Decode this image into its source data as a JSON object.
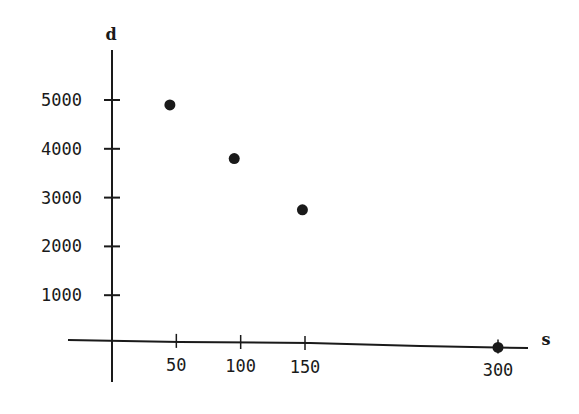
{
  "chart_data": {
    "type": "scatter",
    "title": "",
    "xlabel": "s",
    "ylabel": "d",
    "x_ticks": [
      50,
      100,
      150,
      300
    ],
    "y_ticks": [
      1000,
      2000,
      3000,
      4000,
      5000
    ],
    "x_tick_labels": [
      "50",
      "100",
      "150",
      "300"
    ],
    "y_tick_labels": [
      "1000",
      "2000",
      "3000",
      "4000",
      "5000"
    ],
    "xlim": [
      -35,
      330
    ],
    "ylim": [
      -1000,
      6300
    ],
    "grid": false,
    "legend": null,
    "series": [
      {
        "name": "data",
        "points": [
          {
            "x": 45,
            "y": 4900
          },
          {
            "x": 95,
            "y": 3800
          },
          {
            "x": 148,
            "y": 2750
          },
          {
            "x": 300,
            "y": 0
          }
        ]
      }
    ]
  },
  "colors": {
    "ink": "#1a1a1a",
    "background": "#ffffff"
  }
}
